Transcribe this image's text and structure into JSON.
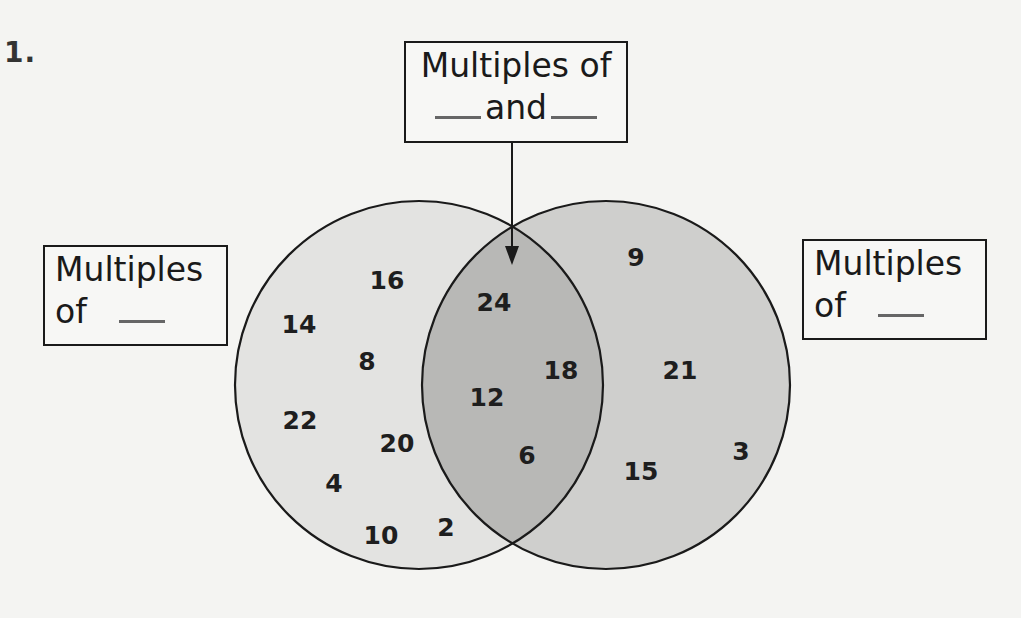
{
  "problem": {
    "number": "1."
  },
  "labels": {
    "top": {
      "line1": "Multiples of",
      "line2_before": "",
      "line2_middle": "and",
      "line2_after": ""
    },
    "left": {
      "line1": "Multiples",
      "line2": "of"
    },
    "right": {
      "line1": "Multiples",
      "line2": "of"
    }
  },
  "colors": {
    "background": "#f4f4f2",
    "left_circle_fill": "#e3e3e1",
    "right_circle_fill": "#cfcfcd",
    "overlap_fill": "#b8b8b6",
    "stroke": "#1a1a1a"
  },
  "venn": {
    "left_only": [
      {
        "value": "16",
        "x": 387,
        "y": 280
      },
      {
        "value": "14",
        "x": 299,
        "y": 324
      },
      {
        "value": "8",
        "x": 367,
        "y": 361
      },
      {
        "value": "22",
        "x": 300,
        "y": 420
      },
      {
        "value": "20",
        "x": 397,
        "y": 443
      },
      {
        "value": "4",
        "x": 334,
        "y": 483
      },
      {
        "value": "10",
        "x": 381,
        "y": 535
      },
      {
        "value": "2",
        "x": 446,
        "y": 527
      }
    ],
    "overlap": [
      {
        "value": "24",
        "x": 494,
        "y": 302
      },
      {
        "value": "18",
        "x": 561,
        "y": 370
      },
      {
        "value": "12",
        "x": 487,
        "y": 397
      },
      {
        "value": "6",
        "x": 527,
        "y": 455
      }
    ],
    "right_only": [
      {
        "value": "9",
        "x": 636,
        "y": 257
      },
      {
        "value": "21",
        "x": 680,
        "y": 370
      },
      {
        "value": "3",
        "x": 741,
        "y": 451
      },
      {
        "value": "15",
        "x": 641,
        "y": 471
      }
    ]
  }
}
